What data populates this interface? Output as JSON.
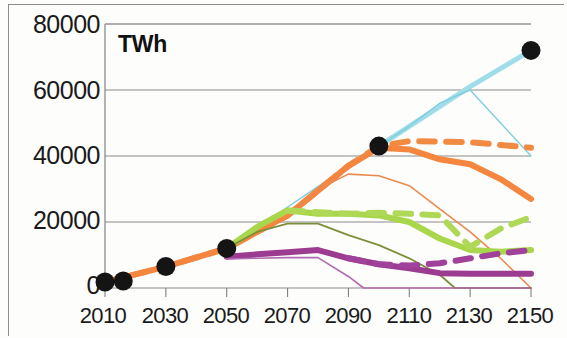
{
  "chart_data": {
    "type": "line",
    "title": "",
    "subtitle": "",
    "unit_label": "TWh",
    "xlabel": "",
    "ylabel": "TWh",
    "xlim": [
      2010,
      2150
    ],
    "ylim": [
      0,
      80000
    ],
    "grid": true,
    "grid_axis": "y",
    "legend": "none",
    "y_ticks": [
      0,
      20000,
      40000,
      60000,
      80000
    ],
    "y_tick_labels": [
      "0",
      "20000",
      "40000",
      "60000",
      "80000"
    ],
    "x_ticks": [
      2010,
      2030,
      2050,
      2070,
      2090,
      2110,
      2130,
      2150
    ],
    "x_tick_labels": [
      "2010",
      "2030",
      "2050",
      "2070",
      "2090",
      "2110",
      "2130",
      "2150"
    ],
    "series": [
      {
        "name": "total-demand-markers",
        "style": "scatter",
        "color": "#141414",
        "marker": "circle",
        "x": [
          2010,
          2016,
          2030,
          2050,
          2100,
          2150
        ],
        "values": [
          1800,
          2100,
          6500,
          12000,
          43000,
          72000
        ]
      },
      {
        "name": "cyan-thick-total",
        "style": "solid-thick",
        "color": "#9FDDE8",
        "width": 5,
        "x": [
          2010,
          2030,
          2050,
          2070,
          2090,
          2100,
          2110,
          2130,
          2150
        ],
        "values": [
          1800,
          6500,
          12000,
          22000,
          37000,
          43000,
          49000,
          61000,
          72000
        ]
      },
      {
        "name": "cyan-thin-alt",
        "style": "solid-thin",
        "color": "#7FCEDD",
        "width": 1.4,
        "x": [
          2010,
          2050,
          2090,
          2100,
          2110,
          2120,
          2130,
          2140,
          2150
        ],
        "values": [
          1800,
          12000,
          37000,
          43000,
          49000,
          56000,
          60000,
          50000,
          40000
        ]
      },
      {
        "name": "orange-dashed",
        "style": "dashed-thick",
        "color": "#F28B42",
        "width": 6,
        "x": [
          2010,
          2030,
          2050,
          2070,
          2090,
          2100,
          2110,
          2130,
          2150
        ],
        "values": [
          1800,
          6500,
          12000,
          22000,
          37000,
          43000,
          44500,
          44200,
          42500
        ]
      },
      {
        "name": "orange-solid-thick",
        "style": "solid-thick",
        "color": "#F5863F",
        "width": 6,
        "x": [
          2010,
          2030,
          2050,
          2070,
          2090,
          2100,
          2110,
          2120,
          2130,
          2140,
          2150
        ],
        "values": [
          1800,
          6500,
          12000,
          22000,
          37000,
          42500,
          42000,
          39000,
          37500,
          33000,
          27000
        ]
      },
      {
        "name": "orange-thin",
        "style": "solid-thin",
        "color": "#E98A50",
        "width": 1.6,
        "x": [
          2070,
          2080,
          2090,
          2100,
          2110,
          2120,
          2130,
          2140,
          2150
        ],
        "values": [
          22000,
          30000,
          34500,
          34000,
          31000,
          24000,
          17000,
          9000,
          0
        ]
      },
      {
        "name": "lightgreen-thick",
        "style": "solid-thick",
        "color": "#A9D64B",
        "width": 6,
        "x": [
          2050,
          2060,
          2070,
          2080,
          2090,
          2100,
          2110,
          2120,
          2130,
          2140,
          2150
        ],
        "values": [
          12000,
          18500,
          23500,
          22500,
          22500,
          22000,
          20000,
          15000,
          11500,
          11000,
          11500
        ]
      },
      {
        "name": "lightgreen-dashed",
        "style": "dashed-thick",
        "color": "#AFD857",
        "width": 6,
        "x": [
          2070,
          2090,
          2100,
          2110,
          2120,
          2130,
          2140,
          2150
        ],
        "values": [
          23500,
          22500,
          22800,
          22500,
          22000,
          12500,
          18000,
          21500
        ]
      },
      {
        "name": "olive-thin",
        "style": "solid-thin",
        "color": "#7E8F3C",
        "width": 1.8,
        "x": [
          2050,
          2060,
          2070,
          2080,
          2090,
          2100,
          2110,
          2120,
          2125,
          2150
        ],
        "values": [
          12000,
          17000,
          19500,
          19500,
          16000,
          13000,
          9000,
          4000,
          0,
          0
        ]
      },
      {
        "name": "purple-thick",
        "style": "solid-thick",
        "color": "#9C3C90",
        "width": 6,
        "x": [
          2050,
          2060,
          2070,
          2080,
          2090,
          2100,
          2110,
          2120,
          2130,
          2140,
          2150
        ],
        "values": [
          9500,
          10200,
          10800,
          11500,
          9000,
          7200,
          6000,
          4500,
          4300,
          4300,
          4300
        ]
      },
      {
        "name": "purple-dashed",
        "style": "dashed-thick",
        "color": "#A0419A",
        "width": 6,
        "x": [
          2090,
          2100,
          2110,
          2120,
          2130,
          2140,
          2150
        ],
        "values": [
          9000,
          7200,
          6800,
          7500,
          9000,
          10500,
          11500
        ]
      },
      {
        "name": "purple-thin",
        "style": "solid-thin",
        "color": "#B16BB0",
        "width": 1.6,
        "x": [
          2050,
          2060,
          2070,
          2080,
          2090,
          2095,
          2150
        ],
        "values": [
          8800,
          9000,
          9200,
          9200,
          3500,
          0,
          0
        ]
      }
    ]
  },
  "axis": {
    "unit_label": "TWh",
    "y_labels": [
      "80000",
      "60000",
      "40000",
      "20000",
      "0"
    ],
    "x_labels": [
      "2010",
      "2030",
      "2050",
      "2070",
      "2090",
      "2110",
      "2130",
      "2150"
    ]
  }
}
